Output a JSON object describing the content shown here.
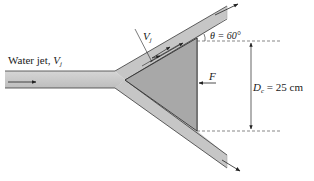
{
  "diagram": {
    "labels": {
      "water_jet": "Water jet, ",
      "water_jet_var": "V",
      "water_jet_sub": "j",
      "vj_var": "V",
      "vj_sub": "j",
      "theta": "θ = 60°",
      "force": "F",
      "diameter_var": "D",
      "diameter_sub": "c",
      "diameter_value": " = 25 cm"
    },
    "parameters": {
      "theta_deg": 60,
      "cone_diameter_cm": 25
    },
    "colors": {
      "jet_fill": "#c9c9c9",
      "jet_edge": "#3a3a3a",
      "cone_fill": "#a8a8a8",
      "cone_edge": "#2a2a2a",
      "dashed": "#555555",
      "arrow": "#222222"
    }
  }
}
